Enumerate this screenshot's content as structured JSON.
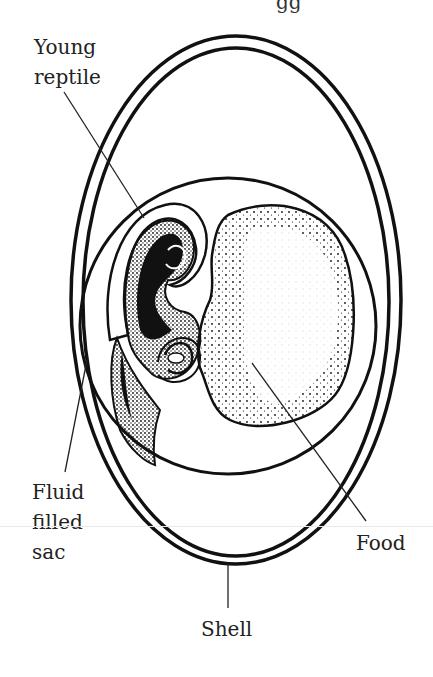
{
  "title_fragment": "gg",
  "labels": {
    "young_reptile": [
      "Young",
      "reptile"
    ],
    "fluid_filled_sac": [
      "Fluid",
      "filled",
      "sac"
    ],
    "food": "Food",
    "shell": "Shell"
  },
  "colors": {
    "ink": "#111111",
    "background": "#ffffff"
  }
}
